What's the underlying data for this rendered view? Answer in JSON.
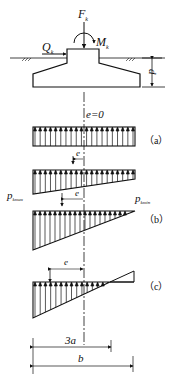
{
  "labels": {
    "force": "F",
    "force_sub": "k",
    "moment": "M",
    "moment_sub": "k",
    "shear": "Q",
    "shear_sub": "k",
    "depth": "d",
    "e_zero": "e=0",
    "e": "e",
    "pmax": "p",
    "pmax_sub": "kmax",
    "pmin": "p",
    "pmin_sub": "kmin",
    "case_a": "（a）",
    "case_b": "（b）",
    "case_c": "（c）",
    "dim_3a": "3a",
    "dim_b": "b"
  },
  "colors": {
    "line": "#111111",
    "background": "#ffffff"
  }
}
